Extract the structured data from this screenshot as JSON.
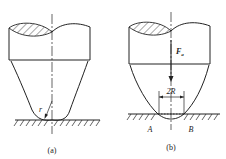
{
  "figure": {
    "panel_a": {
      "caption": "(a)",
      "radius_label": "r"
    },
    "panel_b": {
      "caption": "(b)",
      "force_label": "F",
      "force_subscript": "a",
      "dimension_label": "2R",
      "point_left": "A",
      "point_right": "B"
    },
    "colors": {
      "stroke": "#222222",
      "background": "#ffffff"
    }
  }
}
